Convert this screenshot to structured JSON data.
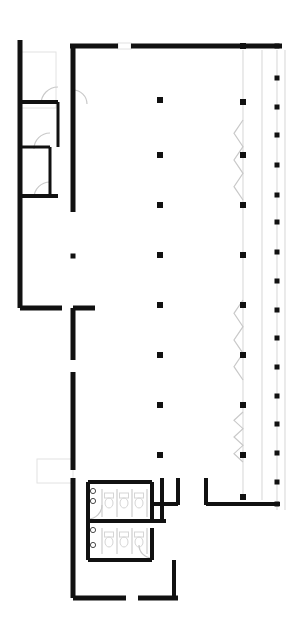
{
  "document": {
    "type": "architectural-floor-plan",
    "title": "Floor Plan",
    "canvas": {
      "width": 301,
      "height": 635
    },
    "background_color": "#ffffff",
    "wall_color": "#111111",
    "light_line_color": "#e2e2e2",
    "mid_line_color": "#c9c9c9",
    "fixture_color": "#d5d5d5"
  },
  "legend": {
    "wall_label": "Structural wall",
    "column_label": "Column",
    "door_label": "Door swing",
    "fixture_label": "Plumbing fixture",
    "glazing_label": "Curtain wall / glazing"
  },
  "geometry": {
    "walls_heavy": [
      {
        "name": "top-exterior-wall-left-segment",
        "x1": 70,
        "y1": 46,
        "x2": 118,
        "y2": 46,
        "w": 5
      },
      {
        "name": "top-exterior-wall-right-segment",
        "x1": 131,
        "y1": 46,
        "x2": 282,
        "y2": 46,
        "w": 5
      },
      {
        "name": "left-exterior-wall-upper",
        "x1": 20,
        "y1": 40,
        "x2": 20,
        "y2": 308,
        "w": 5
      },
      {
        "name": "corridor-wall-vertical",
        "x1": 73,
        "y1": 46,
        "x2": 73,
        "y2": 105,
        "w": 5
      },
      {
        "name": "corridor-wall-vertical-lower",
        "x1": 73,
        "y1": 105,
        "x2": 73,
        "y2": 212,
        "w": 5
      },
      {
        "name": "room-divider-top",
        "x1": 20,
        "y1": 102,
        "x2": 58,
        "y2": 102,
        "w": 4
      },
      {
        "name": "room-divider-mid",
        "x1": 20,
        "y1": 147,
        "x2": 50,
        "y2": 147,
        "w": 3
      },
      {
        "name": "room-divider-low",
        "x1": 20,
        "y1": 196,
        "x2": 58,
        "y2": 196,
        "w": 4
      },
      {
        "name": "room-inner-vertical-a",
        "x1": 58,
        "y1": 102,
        "x2": 58,
        "y2": 147,
        "w": 3
      },
      {
        "name": "room-inner-vertical-b",
        "x1": 50,
        "y1": 147,
        "x2": 50,
        "y2": 196,
        "w": 3
      },
      {
        "name": "bottom-left-return-wall",
        "x1": 20,
        "y1": 308,
        "x2": 62,
        "y2": 308,
        "w": 5
      },
      {
        "name": "lobby-wall-horizontal",
        "x1": 73,
        "y1": 308,
        "x2": 95,
        "y2": 308,
        "w": 5
      },
      {
        "name": "lobby-wall-vertical",
        "x1": 73,
        "y1": 308,
        "x2": 73,
        "y2": 360,
        "w": 5
      },
      {
        "name": "lobby-wall-vertical-lower",
        "x1": 73,
        "y1": 372,
        "x2": 73,
        "y2": 470,
        "w": 5
      },
      {
        "name": "service-core-wall-left",
        "x1": 73,
        "y1": 478,
        "x2": 73,
        "y2": 598,
        "w": 5
      },
      {
        "name": "service-core-wall-bottom-left",
        "x1": 73,
        "y1": 598,
        "x2": 126,
        "y2": 598,
        "w": 5
      },
      {
        "name": "service-core-wall-bottom-right",
        "x1": 138,
        "y1": 598,
        "x2": 178,
        "y2": 598,
        "w": 5
      },
      {
        "name": "restroom-wall-top",
        "x1": 88,
        "y1": 482,
        "x2": 152,
        "y2": 482,
        "w": 4
      },
      {
        "name": "restroom-wall-left",
        "x1": 88,
        "y1": 482,
        "x2": 88,
        "y2": 560,
        "w": 4
      },
      {
        "name": "restroom-wall-right-upper",
        "x1": 152,
        "y1": 482,
        "x2": 152,
        "y2": 520,
        "w": 4
      },
      {
        "name": "restroom-wall-right-lower",
        "x1": 152,
        "y1": 528,
        "x2": 152,
        "y2": 560,
        "w": 4
      },
      {
        "name": "restroom-divider",
        "x1": 88,
        "y1": 521,
        "x2": 152,
        "y2": 521,
        "w": 4
      },
      {
        "name": "restroom-wall-bottom",
        "x1": 88,
        "y1": 560,
        "x2": 152,
        "y2": 560,
        "w": 4
      },
      {
        "name": "restroom-corridor-stub",
        "x1": 152,
        "y1": 521,
        "x2": 166,
        "y2": 521,
        "w": 4
      },
      {
        "name": "corridor-stub-vertical",
        "x1": 162,
        "y1": 478,
        "x2": 162,
        "y2": 521,
        "w": 4
      },
      {
        "name": "lobby-partition-left",
        "x1": 178,
        "y1": 478,
        "x2": 178,
        "y2": 505,
        "w": 4
      },
      {
        "name": "lobby-partition-right",
        "x1": 206,
        "y1": 478,
        "x2": 206,
        "y2": 505,
        "w": 4
      },
      {
        "name": "lobby-bottom-wall",
        "x1": 206,
        "y1": 504,
        "x2": 280,
        "y2": 504,
        "w": 4
      },
      {
        "name": "lobby-bottom-wall-left",
        "x1": 152,
        "y1": 504,
        "x2": 178,
        "y2": 504,
        "w": 4
      },
      {
        "name": "service-core-wall-right",
        "x1": 174,
        "y1": 560,
        "x2": 174,
        "y2": 598,
        "w": 4
      }
    ],
    "columns_center": {
      "name": "interior-column-line",
      "x": 160,
      "size": 6,
      "ys": [
        100,
        155,
        205,
        255,
        305,
        355,
        405,
        455
      ]
    },
    "columns_inner_right": {
      "name": "perimeter-column-line-inner",
      "x": 243,
      "size": 6,
      "ys": [
        46,
        102,
        155,
        205,
        255,
        305,
        355,
        405,
        455,
        497
      ]
    },
    "columns_outer_right": {
      "name": "perimeter-column-line-outer",
      "x": 277,
      "size": 5,
      "ys": [
        46,
        78,
        107,
        135,
        165,
        195,
        222,
        252,
        281,
        310,
        338,
        367,
        396,
        424,
        453,
        482,
        504
      ]
    },
    "columns_misc": [
      {
        "name": "column-left-bay",
        "x": 73,
        "y": 256,
        "size": 5
      }
    ],
    "glazing_lines": [
      {
        "name": "curtain-wall-inner",
        "x": 243,
        "y1": 50,
        "y2": 500
      },
      {
        "name": "curtain-wall-mid",
        "x": 262,
        "y1": 50,
        "y2": 500
      },
      {
        "name": "curtain-wall-outer",
        "x": 277,
        "y1": 50,
        "y2": 510
      },
      {
        "name": "curtain-wall-far",
        "x": 285,
        "y1": 50,
        "y2": 510
      }
    ],
    "mullion_zigzags": [
      {
        "name": "expansion-joint-upper",
        "x": 243,
        "y": 120,
        "h": 80
      },
      {
        "name": "expansion-joint-lower",
        "x": 243,
        "y": 300,
        "h": 80
      },
      {
        "name": "expansion-joint-bottom",
        "x": 243,
        "y": 412,
        "h": 50
      }
    ],
    "door_arcs": [
      {
        "name": "door-swing-office-a",
        "cx": 58,
        "cy": 104,
        "r": 17,
        "start": 180,
        "end": 270
      },
      {
        "name": "door-swing-office-b",
        "cx": 50,
        "cy": 149,
        "r": 16,
        "start": 180,
        "end": 270
      },
      {
        "name": "door-swing-office-c",
        "cx": 50,
        "cy": 198,
        "r": 16,
        "start": 180,
        "end": 270
      },
      {
        "name": "door-swing-corridor",
        "cx": 73,
        "cy": 104,
        "r": 14,
        "start": 270,
        "end": 360
      },
      {
        "name": "door-swing-restroom-a",
        "cx": 88,
        "cy": 505,
        "r": 14,
        "start": 0,
        "end": 90
      },
      {
        "name": "door-swing-restroom-b",
        "cx": 152,
        "cy": 545,
        "r": 13,
        "start": 90,
        "end": 180
      }
    ],
    "rectangles_light": [
      {
        "name": "stair-shaft-outline",
        "x": 20,
        "y": 52,
        "w": 36,
        "h": 56
      },
      {
        "name": "entry-vestibule-slab",
        "x": 37,
        "y": 459,
        "w": 36,
        "h": 24
      },
      {
        "name": "top-opening-fill",
        "x": 118,
        "y": 43,
        "w": 13,
        "h": 6
      }
    ],
    "fixtures": {
      "toilets_upper": [
        {
          "name": "toilet-fixture",
          "x": 109,
          "y": 497
        },
        {
          "name": "toilet-fixture",
          "x": 124,
          "y": 497
        },
        {
          "name": "toilet-fixture",
          "x": 139,
          "y": 497
        }
      ],
      "toilets_lower": [
        {
          "name": "toilet-fixture",
          "x": 109,
          "y": 536
        },
        {
          "name": "toilet-fixture",
          "x": 124,
          "y": 536
        },
        {
          "name": "toilet-fixture",
          "x": 139,
          "y": 536
        }
      ],
      "partitions_upper": [
        {
          "name": "stall-partition",
          "x": 102,
          "y": 489,
          "h": 28
        },
        {
          "name": "stall-partition",
          "x": 117,
          "y": 489,
          "h": 28
        },
        {
          "name": "stall-partition",
          "x": 132,
          "y": 489,
          "h": 28
        },
        {
          "name": "stall-partition",
          "x": 147,
          "y": 489,
          "h": 28
        }
      ],
      "partitions_lower": [
        {
          "name": "stall-partition",
          "x": 102,
          "y": 528,
          "h": 26
        },
        {
          "name": "stall-partition",
          "x": 117,
          "y": 528,
          "h": 26
        },
        {
          "name": "stall-partition",
          "x": 132,
          "y": 528,
          "h": 26
        },
        {
          "name": "stall-partition",
          "x": 147,
          "y": 528,
          "h": 26
        }
      ],
      "sinks_upper": [
        {
          "name": "sink-fixture",
          "x": 93,
          "y": 491
        },
        {
          "name": "sink-fixture",
          "x": 93,
          "y": 501
        }
      ],
      "sinks_lower": [
        {
          "name": "sink-fixture",
          "x": 93,
          "y": 530
        },
        {
          "name": "sink-fixture",
          "x": 93,
          "y": 545
        }
      ]
    }
  }
}
